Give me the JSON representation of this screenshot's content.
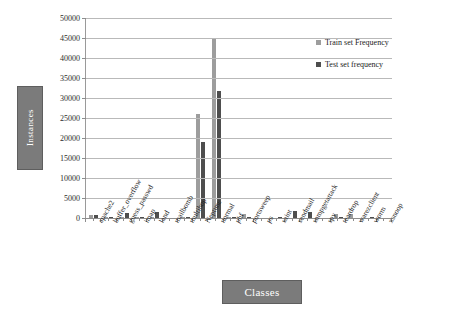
{
  "chart_data": {
    "type": "bar",
    "title": "",
    "xlabel": "Classes",
    "ylabel": "Instances",
    "ylim": [
      0,
      50000
    ],
    "ytick_step": 5000,
    "yticks": [
      "0",
      "5000",
      "10000",
      "15000",
      "20000",
      "25000",
      "30000",
      "35000",
      "40000",
      "45000",
      "50000"
    ],
    "grid": true,
    "legend_position": "top-right",
    "categories": [
      "apache2",
      "buffer_overflow",
      "guess_passwd",
      "imap",
      "land",
      "mailbomb",
      "multihop",
      "Neptune",
      "normal",
      "phf",
      "portsweep",
      "ps",
      "saint",
      "sendmail",
      "snmpgetattack",
      "spy",
      "teardrop",
      "warezclient",
      "worm",
      "xsnoop"
    ],
    "series": [
      {
        "name": "Train set Frequency",
        "color": "#9d9d9d",
        "values": [
          700,
          30,
          53,
          11,
          18,
          0,
          7,
          26000,
          45000,
          4,
          1040,
          0,
          0,
          0,
          0,
          0,
          979,
          890,
          0,
          0
        ]
      },
      {
        "name": "Test set frequency",
        "color": "#4e4e4e",
        "values": [
          737,
          20,
          1231,
          1,
          1500,
          0,
          18,
          19000,
          31800,
          2,
          350,
          0,
          319,
          1800,
          1600,
          0,
          12,
          0,
          260,
          0
        ]
      }
    ]
  },
  "axis_titles": {
    "y": "Instances",
    "x": "Classes"
  },
  "legend": {
    "items": [
      {
        "label": "Train set Frequency",
        "marker": "square-swatch",
        "color": "#9d9d9d"
      },
      {
        "label": "Test set frequency",
        "marker": "square-swatch",
        "color": "#4e4e4e"
      }
    ]
  },
  "colors": {
    "train": "#9d9d9d",
    "test": "#4e4e4e",
    "grid": "#b9b9b9",
    "axis": "#8d8d8d",
    "label_box": "#7b7b7b",
    "label_text": "#ffffff",
    "background": "#ffffff"
  }
}
